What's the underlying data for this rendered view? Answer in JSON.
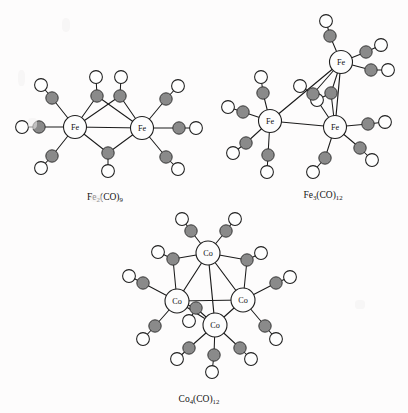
{
  "page": {
    "background": "#fdfcfc",
    "width": 408,
    "height": 413
  },
  "palette": {
    "carbon_fill": "#8a8a8a",
    "oxygen_fill": "#fefefe",
    "metal_fill": "#fdfdfd",
    "bond_stroke": "#1b1b1b",
    "text": "#111111"
  },
  "structures": [
    {
      "id": "fe2co9",
      "formula_main": "Fe",
      "formula_sub1": "2",
      "formula_mid": "(CO)",
      "formula_sub2": "9",
      "label_full": "Fe2(CO)9",
      "label_x": 105,
      "label_y": 200,
      "metal_symbol": "Fe",
      "metals": [
        {
          "name": "metal-fe-left",
          "x": 75,
          "y": 127,
          "r": 11.5
        },
        {
          "name": "metal-fe-right",
          "x": 142,
          "y": 128,
          "r": 11.5
        }
      ],
      "metal_bonds": [
        [
          0,
          1
        ]
      ],
      "carbonyls": [
        {
          "name": "co-terminal-left-upper",
          "cx": 52,
          "cy": 98,
          "ox": 41,
          "oy": 85,
          "from": 0
        },
        {
          "name": "co-terminal-left-mid",
          "cx": 39,
          "cy": 127,
          "ox": 22,
          "oy": 127,
          "from": 0
        },
        {
          "name": "co-terminal-left-lower",
          "cx": 52,
          "cy": 156,
          "ox": 41,
          "oy": 168,
          "from": 0
        },
        {
          "name": "co-terminal-right-upper",
          "cx": 166,
          "cy": 99,
          "ox": 178,
          "oy": 86,
          "from": 1
        },
        {
          "name": "co-terminal-right-mid",
          "cx": 179,
          "cy": 128,
          "ox": 196,
          "oy": 128,
          "from": 1
        },
        {
          "name": "co-terminal-right-lower",
          "cx": 166,
          "cy": 157,
          "ox": 178,
          "oy": 169,
          "from": 1
        },
        {
          "name": "co-bridging-top-left",
          "cx": 97,
          "cy": 96,
          "ox": 96,
          "oy": 77,
          "from": 2
        },
        {
          "name": "co-bridging-top-right",
          "cx": 120,
          "cy": 96,
          "ox": 121,
          "oy": 77,
          "from": 2
        },
        {
          "name": "co-bridging-bottom",
          "cx": 108,
          "cy": 153,
          "ox": 108,
          "oy": 171,
          "from": 2
        }
      ]
    },
    {
      "id": "fe3co12",
      "formula_main": "Fe",
      "formula_sub1": "3",
      "formula_mid": "(CO)",
      "formula_sub2": "12",
      "label_full": "Fe3(CO)12",
      "label_x": 323,
      "label_y": 198,
      "metal_symbol": "Fe",
      "metals": [
        {
          "name": "metal-fe-left",
          "x": 270,
          "y": 121,
          "r": 11.5
        },
        {
          "name": "metal-fe-top-right",
          "x": 341,
          "y": 62,
          "r": 11.5
        },
        {
          "name": "metal-fe-bottom-right",
          "x": 335,
          "y": 127,
          "r": 11.5
        }
      ],
      "metal_bonds": [
        [
          0,
          1
        ],
        [
          0,
          2
        ],
        [
          1,
          2
        ]
      ],
      "carbonyls": [
        {
          "name": "co-left-upper",
          "cx": 263,
          "cy": 93,
          "ox": 261,
          "oy": 77,
          "from": 0
        },
        {
          "name": "co-left-mid",
          "cx": 243,
          "cy": 112,
          "ox": 228,
          "oy": 107,
          "from": 0
        },
        {
          "name": "co-left-lower",
          "cx": 246,
          "cy": 143,
          "ox": 233,
          "oy": 153,
          "from": 0
        },
        {
          "name": "co-left-bottom",
          "cx": 268,
          "cy": 155,
          "ox": 267,
          "oy": 172,
          "from": 0
        },
        {
          "name": "co-top-upper",
          "cx": 330,
          "cy": 36,
          "ox": 326,
          "oy": 21,
          "from": 1
        },
        {
          "name": "co-top-right-a",
          "cx": 366,
          "cy": 52,
          "ox": 381,
          "oy": 45,
          "from": 1
        },
        {
          "name": "co-top-right-b",
          "cx": 371,
          "cy": 70,
          "ox": 388,
          "oy": 70,
          "from": 1
        },
        {
          "name": "co-bridge-upper",
          "cx": 331,
          "cy": 93,
          "ox": 317,
          "oy": 100,
          "from": 3
        },
        {
          "name": "co-bridge-lower",
          "cx": 313,
          "cy": 94,
          "ox": 300,
          "oy": 86,
          "from": 3
        },
        {
          "name": "co-bottom-right-a",
          "cx": 368,
          "cy": 124,
          "ox": 385,
          "oy": 122,
          "from": 2
        },
        {
          "name": "co-bottom-right-b",
          "cx": 360,
          "cy": 148,
          "ox": 372,
          "oy": 160,
          "from": 2
        },
        {
          "name": "co-bottom-lower",
          "cx": 325,
          "cy": 158,
          "ox": 313,
          "oy": 172,
          "from": 2
        }
      ]
    },
    {
      "id": "co4co12",
      "formula_main": "Co",
      "formula_sub1": "4",
      "formula_mid": "(CO)",
      "formula_sub2": "12",
      "label_full": "Co4(CO)12",
      "label_x": 199,
      "label_y": 402,
      "metal_symbol": "Co",
      "metals": [
        {
          "name": "metal-co-top",
          "x": 208,
          "y": 253,
          "r": 12
        },
        {
          "name": "metal-co-left",
          "x": 177,
          "y": 301,
          "r": 12
        },
        {
          "name": "metal-co-right",
          "x": 243,
          "y": 300,
          "r": 12
        },
        {
          "name": "metal-co-front",
          "x": 215,
          "y": 325,
          "r": 12
        }
      ],
      "metal_bonds": [
        [
          0,
          1
        ],
        [
          0,
          2
        ],
        [
          0,
          3
        ],
        [
          1,
          2
        ],
        [
          1,
          3
        ],
        [
          2,
          3
        ]
      ],
      "carbonyls": [
        {
          "name": "co-top-left",
          "cx": 191,
          "cy": 231,
          "ox": 182,
          "oy": 219,
          "from": 0
        },
        {
          "name": "co-top-right",
          "cx": 226,
          "cy": 231,
          "ox": 235,
          "oy": 219,
          "from": 0
        },
        {
          "name": "co-top-bridge-left",
          "cx": 173,
          "cy": 259,
          "ox": 158,
          "oy": 252,
          "from": 0
        },
        {
          "name": "co-top-bridge-right",
          "cx": 247,
          "cy": 260,
          "ox": 261,
          "oy": 253,
          "from": 0
        },
        {
          "name": "co-left-upper",
          "cx": 143,
          "cy": 283,
          "ox": 129,
          "oy": 276,
          "from": 1
        },
        {
          "name": "co-left-lower",
          "cx": 155,
          "cy": 326,
          "ox": 143,
          "oy": 339,
          "from": 1
        },
        {
          "name": "co-right-upper",
          "cx": 276,
          "cy": 283,
          "ox": 290,
          "oy": 277,
          "from": 2
        },
        {
          "name": "co-right-lower",
          "cx": 265,
          "cy": 326,
          "ox": 276,
          "oy": 339,
          "from": 2
        },
        {
          "name": "co-bridge-front",
          "cx": 196,
          "cy": 308,
          "ox": 189,
          "oy": 321,
          "from": 3
        },
        {
          "name": "co-front-left",
          "cx": 189,
          "cy": 348,
          "ox": 177,
          "oy": 359,
          "from": 3
        },
        {
          "name": "co-front-bottom",
          "cx": 214,
          "cy": 355,
          "ox": 212,
          "oy": 372,
          "from": 3
        },
        {
          "name": "co-front-right",
          "cx": 240,
          "cy": 348,
          "ox": 251,
          "oy": 359,
          "from": 3
        }
      ]
    }
  ],
  "geometry": {
    "carbon_radius": 6.2,
    "oxygen_radius": 6.4
  }
}
